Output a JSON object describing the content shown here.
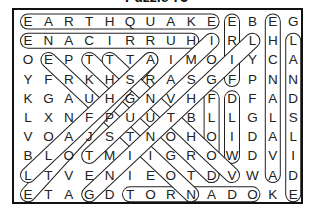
{
  "title": "Puzzle 73",
  "grid": [
    "EARTHQUAKEEBEG",
    "ENACIRRUHIRLHL",
    "OEPTTTAIMOIYCA",
    "YFRKHSRASGFPNN",
    "KGAUHGNVHFDFAD",
    "LXNFPUUTBLLGLS",
    "VOAJSTNOHOIDAL",
    "BLOTMIIGROWDVI",
    "LTVENIEOTDVWAD",
    "ETAGDTORNADOKE"
  ],
  "found_words": [
    {
      "word": "EARTHQUAKE",
      "from": [
        0,
        0
      ],
      "to": [
        0,
        9
      ]
    },
    {
      "word": "HURRICANE",
      "from": [
        1,
        8
      ],
      "to": [
        1,
        0
      ]
    },
    {
      "word": "TORNADO",
      "from": [
        9,
        5
      ],
      "to": [
        9,
        11
      ]
    },
    {
      "word": "FIRE",
      "from": [
        3,
        10
      ],
      "to": [
        0,
        10
      ]
    },
    {
      "word": "AVALANCHE",
      "from": [
        8,
        12
      ],
      "to": [
        0,
        12
      ]
    },
    {
      "word": "LANDSLIDE",
      "from": [
        1,
        13
      ],
      "to": [
        9,
        13
      ]
    },
    {
      "word": "WILD",
      "from": [
        7,
        10
      ],
      "to": [
        4,
        10
      ]
    },
    {
      "word": "FLOOD",
      "from": [
        4,
        9
      ],
      "to": [
        8,
        9
      ]
    },
    {
      "word": "diag1",
      "from": [
        2,
        1
      ],
      "to": [
        9,
        8
      ]
    },
    {
      "word": "diag2",
      "from": [
        2,
        3
      ],
      "to": [
        8,
        9
      ]
    },
    {
      "word": "diag3",
      "from": [
        2,
        6
      ],
      "to": [
        9,
        0
      ]
    },
    {
      "word": "diag4",
      "from": [
        2,
        4
      ],
      "to": [
        8,
        10
      ]
    },
    {
      "word": "diag5",
      "from": [
        1,
        9
      ],
      "to": [
        7,
        3
      ]
    },
    {
      "word": "diag6",
      "from": [
        1,
        11
      ],
      "to": [
        9,
        3
      ]
    },
    {
      "word": "diag7",
      "from": [
        8,
        0
      ],
      "to": [
        2,
        6
      ]
    }
  ],
  "colors": {
    "ink": "#222222",
    "border": "#111111"
  }
}
